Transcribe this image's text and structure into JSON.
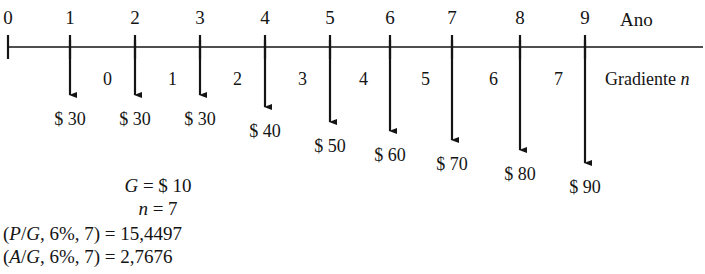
{
  "axis": {
    "caption": "Ano",
    "caption_x": 620,
    "caption_y": 14,
    "line_y": 47,
    "line_x1": 8,
    "line_x2": 703,
    "tick_top": 35,
    "tick_bottom": 59,
    "years": [
      {
        "label": "0",
        "x": 8
      },
      {
        "label": "1",
        "x": 70
      },
      {
        "label": "2",
        "x": 135
      },
      {
        "label": "3",
        "x": 200
      },
      {
        "label": "4",
        "x": 265
      },
      {
        "label": "5",
        "x": 330
      },
      {
        "label": "6",
        "x": 390
      },
      {
        "label": "7",
        "x": 452
      },
      {
        "label": "8",
        "x": 520
      },
      {
        "label": "9",
        "x": 585
      }
    ]
  },
  "gradient": {
    "caption": "Gradiente",
    "caption_var": "n",
    "caption_x": 605,
    "caption_y": 78,
    "numbers": [
      {
        "label": "0",
        "x": 98,
        "y": 78
      },
      {
        "label": "1",
        "x": 163,
        "y": 78
      },
      {
        "label": "2",
        "x": 228,
        "y": 78
      },
      {
        "label": "3",
        "x": 293,
        "y": 78
      },
      {
        "label": "4",
        "x": 354,
        "y": 78
      },
      {
        "label": "5",
        "x": 416,
        "y": 78
      },
      {
        "label": "6",
        "x": 484,
        "y": 78
      },
      {
        "label": "7",
        "x": 549,
        "y": 78
      }
    ]
  },
  "cash_flows": [
    {
      "year": "1",
      "x": 70,
      "amount": "$ 30",
      "arrow_end": 95,
      "label_x": 38,
      "label_y": 118
    },
    {
      "year": "2",
      "x": 135,
      "amount": "$ 30",
      "arrow_end": 95,
      "label_x": 103,
      "label_y": 118
    },
    {
      "year": "3",
      "x": 200,
      "amount": "$ 30",
      "arrow_end": 95,
      "label_x": 168,
      "label_y": 118
    },
    {
      "year": "4",
      "x": 265,
      "amount": "$ 40",
      "arrow_end": 107,
      "label_x": 233,
      "label_y": 130
    },
    {
      "year": "5",
      "x": 330,
      "amount": "$ 50",
      "arrow_end": 122,
      "label_x": 298,
      "label_y": 145
    },
    {
      "year": "6",
      "x": 390,
      "amount": "$ 60",
      "arrow_end": 131,
      "label_x": 358,
      "label_y": 154
    },
    {
      "year": "7",
      "x": 452,
      "amount": "$ 70",
      "arrow_end": 140,
      "label_x": 420,
      "label_y": 163
    },
    {
      "year": "8",
      "x": 520,
      "amount": "$ 80",
      "arrow_end": 150,
      "label_x": 488,
      "label_y": 173
    },
    {
      "year": "9",
      "x": 585,
      "amount": "$ 90",
      "arrow_end": 163,
      "label_x": 553,
      "label_y": 186
    }
  ],
  "notes": {
    "g_var": "G",
    "g_value": "= $ 10",
    "n_var": "n",
    "n_value": "= 7",
    "factor_pg": {
      "open": "(",
      "p": "P",
      "slash": "/",
      "g": "G",
      "rest": ", 6%, 7) = 15,4497"
    },
    "factor_ag": {
      "open": "(",
      "a": "A",
      "slash": "/",
      "g": "G",
      "rest": ", 6%, 7) = 2,7676"
    },
    "g_y": 180,
    "n_y": 203,
    "pg_y": 228,
    "ag_y": 251,
    "center_x": 8,
    "left_x": 3
  },
  "colors": {
    "ink": "#141414",
    "background": "#ffffff"
  }
}
